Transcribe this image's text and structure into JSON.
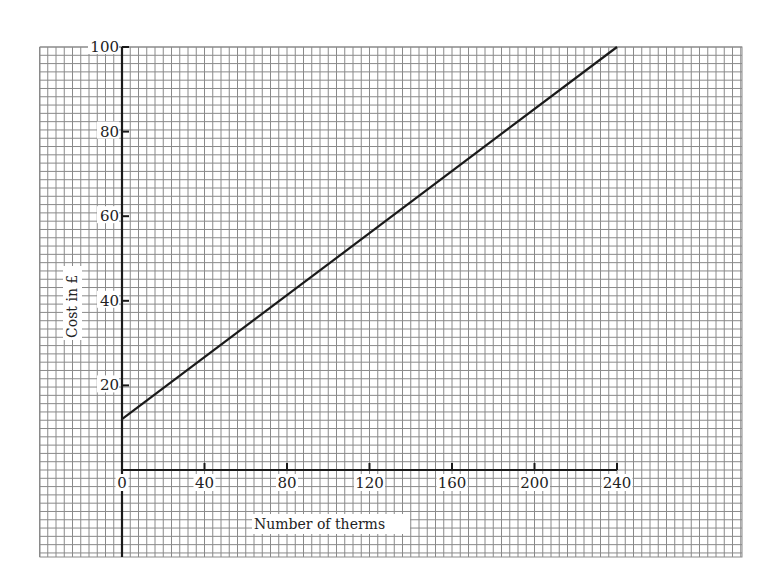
{
  "chart_data": {
    "type": "line",
    "title": "",
    "xlabel": "Number of therms",
    "ylabel": "Cost in £",
    "xlim": [
      0,
      240
    ],
    "ylim": [
      0,
      100
    ],
    "x_ticks": [
      0,
      40,
      80,
      120,
      160,
      200,
      240
    ],
    "y_ticks": [
      20,
      40,
      60,
      80,
      100
    ],
    "x_tick_labels": [
      "0",
      "40",
      "80",
      "120",
      "160",
      "200",
      "240"
    ],
    "y_tick_labels": [
      "20",
      "40",
      "60",
      "80",
      "100"
    ],
    "grid": true,
    "legend": null,
    "series": [
      {
        "name": "Cost",
        "x": [
          0,
          240
        ],
        "y": [
          12,
          100
        ]
      }
    ],
    "colors": {
      "line": "#1a1a1a",
      "axis": "#1a1a1a",
      "grid": "#8a8a8a",
      "background": "#ffffff"
    }
  }
}
